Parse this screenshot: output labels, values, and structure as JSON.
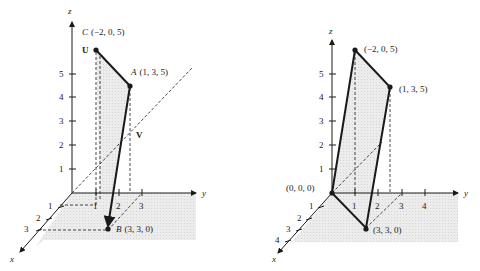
{
  "left_figure": {
    "axes": {
      "x": "x",
      "y": "y",
      "z": "z"
    },
    "z_ticks": [
      "1",
      "2",
      "3",
      "4",
      "5"
    ],
    "y_ticks": [
      "1",
      "2",
      "3"
    ],
    "x_ticks": [
      "1",
      "2",
      "3"
    ],
    "points": {
      "C": {
        "name": "C",
        "coords": "(−2, 0, 5)"
      },
      "A": {
        "name": "A",
        "coords": "(1, 3, 5)"
      },
      "B": {
        "name": "B",
        "coords": "(3, 3, 0)"
      }
    },
    "vectors": {
      "u": "U",
      "v": "V"
    }
  },
  "right_figure": {
    "axes": {
      "x": "x",
      "y": "y",
      "z": "z"
    },
    "z_ticks": [
      "1",
      "2",
      "3",
      "4",
      "5"
    ],
    "y_ticks": [
      "1",
      "2",
      "3",
      "4"
    ],
    "x_ticks": [
      "1",
      "2",
      "3",
      "4"
    ],
    "points": {
      "origin": "(0, 0, 0)",
      "p1": "(−2, 0, 5)",
      "p2": "(1, 3, 5)",
      "p3": "(3, 3, 0)"
    }
  },
  "colors": {
    "ink": "#1a1a1a",
    "shade": "#e6e6e6",
    "floor": "#eeeeee"
  }
}
